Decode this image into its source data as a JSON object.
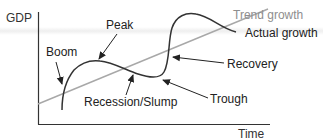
{
  "diagram": {
    "axes": {
      "y_label": "GDP",
      "x_label": "Time"
    },
    "series": [
      {
        "name": "Trend growth",
        "color": "#a8a8a8",
        "style": "straight rising line"
      },
      {
        "name": "Actual growth",
        "color": "#333333",
        "style": "wavy curve around trend"
      }
    ],
    "labels": {
      "boom": "Boom",
      "peak": "Peak",
      "recession": "Recession/Slump",
      "trough": "Trough",
      "recovery": "Recovery",
      "trend_growth": "Trend growth",
      "actual_growth": "Actual growth"
    },
    "colors": {
      "axis": "#333333",
      "curve": "#333333",
      "trend": "#a8a8a8",
      "text": "#222222",
      "trend_text": "#8e8e8e"
    }
  }
}
